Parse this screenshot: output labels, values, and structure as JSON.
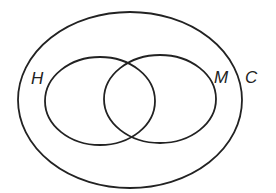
{
  "diagram": {
    "type": "venn",
    "background": "#ffffff",
    "stroke_color": "#222222",
    "sets": [
      {
        "id": "C",
        "label": "C",
        "role": "universal/outer set"
      },
      {
        "id": "H",
        "label": "H",
        "role": "inner set (left)"
      },
      {
        "id": "M",
        "label": "M",
        "role": "inner set (right)"
      }
    ],
    "relations": [
      "H ⊂ C",
      "M ⊂ C",
      "H ∩ M ≠ ∅"
    ]
  }
}
